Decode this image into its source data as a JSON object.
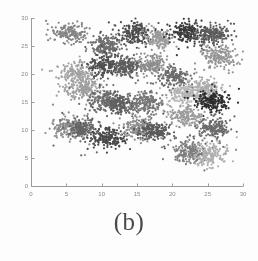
{
  "figure": {
    "caption": "(b)",
    "background_color": "#fdfdfd"
  },
  "chart_data": {
    "type": "scatter",
    "title": "",
    "xlabel": "",
    "ylabel": "",
    "xlim": [
      0,
      30
    ],
    "ylim": [
      0,
      30
    ],
    "grid": false,
    "legend": false,
    "x_ticks": [
      0,
      5,
      10,
      15,
      20,
      25,
      30
    ],
    "y_ticks": [
      0,
      5,
      10,
      15,
      20,
      25,
      30
    ],
    "x_tick_labels": [
      "0",
      "5",
      "10",
      "15",
      "20",
      "25",
      "30"
    ],
    "y_tick_labels": [
      "0",
      "5",
      "10",
      "15",
      "20",
      "25",
      "30"
    ],
    "axis_color": "#9a9a9a",
    "point_size": 1.1,
    "n_points_per_cluster": 160,
    "clusters": [
      {
        "name": "c01",
        "cx": 5.6,
        "cy": 27.4,
        "sx": 1.15,
        "sy": 0.85,
        "color": "#848484",
        "n": 165
      },
      {
        "name": "c02",
        "cx": 10.7,
        "cy": 25.2,
        "sx": 1.05,
        "sy": 0.9,
        "color": "#6e6e6e",
        "n": 170
      },
      {
        "name": "c03",
        "cx": 14.6,
        "cy": 27.3,
        "sx": 1.1,
        "sy": 0.95,
        "color": "#4d4d4d",
        "n": 180
      },
      {
        "name": "c04",
        "cx": 18.3,
        "cy": 26.4,
        "sx": 1.0,
        "sy": 0.8,
        "color": "#9a9a9a",
        "n": 150
      },
      {
        "name": "c05",
        "cx": 22.1,
        "cy": 27.5,
        "sx": 1.05,
        "sy": 0.85,
        "color": "#3a3a3a",
        "n": 185
      },
      {
        "name": "c06",
        "cx": 25.6,
        "cy": 27.1,
        "sx": 1.2,
        "sy": 0.95,
        "color": "#5c5c5c",
        "n": 190
      },
      {
        "name": "c07",
        "cx": 26.6,
        "cy": 23.1,
        "sx": 1.25,
        "sy": 1.0,
        "color": "#959595",
        "n": 175
      },
      {
        "name": "c08",
        "cx": 10.3,
        "cy": 21.5,
        "sx": 1.1,
        "sy": 0.95,
        "color": "#4f4f4f",
        "n": 180
      },
      {
        "name": "c09",
        "cx": 13.5,
        "cy": 21.4,
        "sx": 1.05,
        "sy": 0.85,
        "color": "#5e5e5e",
        "n": 170
      },
      {
        "name": "c10",
        "cx": 16.9,
        "cy": 21.6,
        "sx": 1.0,
        "sy": 0.85,
        "color": "#8d8d8d",
        "n": 160
      },
      {
        "name": "c11",
        "cx": 6.4,
        "cy": 20.0,
        "sx": 1.25,
        "sy": 1.1,
        "color": "#a3a3a3",
        "n": 175
      },
      {
        "name": "c12",
        "cx": 20.4,
        "cy": 19.5,
        "sx": 1.0,
        "sy": 0.85,
        "color": "#6b6b6b",
        "n": 160
      },
      {
        "name": "c13",
        "cx": 7.3,
        "cy": 17.1,
        "sx": 1.1,
        "sy": 0.95,
        "color": "#9e9e9e",
        "n": 165
      },
      {
        "name": "c14",
        "cx": 25.1,
        "cy": 17.2,
        "sx": 1.15,
        "sy": 0.95,
        "color": "#aaaaaa",
        "n": 165
      },
      {
        "name": "c15",
        "cx": 21.8,
        "cy": 16.4,
        "sx": 1.1,
        "sy": 0.9,
        "color": "#b4b4b4",
        "n": 155
      },
      {
        "name": "c16",
        "cx": 10.5,
        "cy": 15.2,
        "sx": 1.2,
        "sy": 0.95,
        "color": "#6f6f6f",
        "n": 180
      },
      {
        "name": "c17",
        "cx": 12.6,
        "cy": 14.7,
        "sx": 1.05,
        "sy": 0.85,
        "color": "#606060",
        "n": 165
      },
      {
        "name": "c18",
        "cx": 16.2,
        "cy": 14.9,
        "sx": 1.2,
        "sy": 1.0,
        "color": "#757575",
        "n": 185
      },
      {
        "name": "c19",
        "cx": 25.8,
        "cy": 15.1,
        "sx": 1.2,
        "sy": 0.9,
        "color": "#2e2e2e",
        "n": 195
      },
      {
        "name": "c20",
        "cx": 21.9,
        "cy": 12.3,
        "sx": 1.15,
        "sy": 0.95,
        "color": "#9c9c9c",
        "n": 165
      },
      {
        "name": "c21",
        "cx": 5.4,
        "cy": 10.5,
        "sx": 1.15,
        "sy": 0.9,
        "color": "#8b8b8b",
        "n": 170
      },
      {
        "name": "c22",
        "cx": 7.4,
        "cy": 10.0,
        "sx": 1.05,
        "sy": 0.85,
        "color": "#656565",
        "n": 165
      },
      {
        "name": "c23",
        "cx": 11.1,
        "cy": 8.6,
        "sx": 1.15,
        "sy": 0.95,
        "color": "#4a4a4a",
        "n": 180
      },
      {
        "name": "c24",
        "cx": 15.2,
        "cy": 10.4,
        "sx": 1.1,
        "sy": 0.95,
        "color": "#8f8f8f",
        "n": 170
      },
      {
        "name": "c25",
        "cx": 17.4,
        "cy": 9.9,
        "sx": 1.05,
        "sy": 0.85,
        "color": "#5a5a5a",
        "n": 170
      },
      {
        "name": "c26",
        "cx": 25.9,
        "cy": 10.3,
        "sx": 1.1,
        "sy": 0.9,
        "color": "#6a6a6a",
        "n": 170
      },
      {
        "name": "c27",
        "cx": 22.4,
        "cy": 6.0,
        "sx": 1.2,
        "sy": 0.95,
        "color": "#7d7d7d",
        "n": 180
      },
      {
        "name": "c28",
        "cx": 25.4,
        "cy": 5.5,
        "sx": 1.15,
        "sy": 0.9,
        "color": "#b0b0b0",
        "n": 165
      }
    ]
  }
}
